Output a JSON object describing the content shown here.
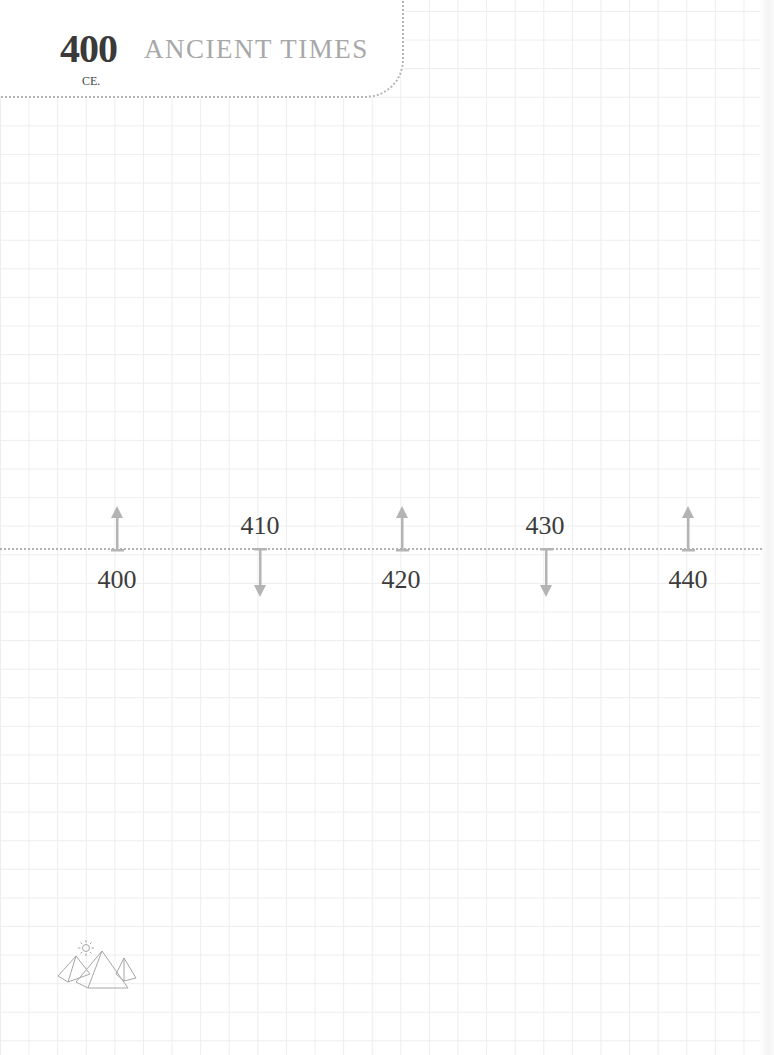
{
  "header": {
    "year": "400",
    "era": "CE.",
    "title": "ANCIENT TIMES"
  },
  "timeline": {
    "markers": [
      {
        "year": "400",
        "direction": "up",
        "label_position": "below",
        "x": 117
      },
      {
        "year": "410",
        "direction": "down",
        "label_position": "above",
        "x": 260
      },
      {
        "year": "420",
        "direction": "up",
        "label_position": "below",
        "x": 402
      },
      {
        "year": "430",
        "direction": "down",
        "label_position": "above",
        "x": 546
      },
      {
        "year": "440",
        "direction": "up",
        "label_position": "below",
        "x": 688
      }
    ]
  },
  "footer": {
    "icon": "pyramids-with-sun-icon"
  },
  "colors": {
    "grid": "#ededed",
    "dots": "#b2b2b2",
    "arrow": "#b4b4b4",
    "title": "#a8a8a8",
    "year_text": "#3a3a3a"
  }
}
